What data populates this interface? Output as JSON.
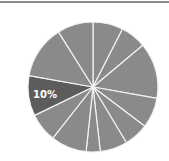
{
  "chart_data": {
    "type": "pie",
    "title": "",
    "start_angle_deg": 0,
    "direction": "clockwise",
    "slice_color": "#8a8a8a",
    "highlight_color": "#5c5c5c",
    "separator_color": "#f2f2f2",
    "values": [
      7.5,
      6.4,
      13.9,
      7.5,
      6.1,
      6.8,
      3.5,
      8.9,
      7.2,
      10.0,
      13.3,
      8.9
    ],
    "highlight_index": 9,
    "labels": [
      "",
      "",
      "",
      "",
      "",
      "",
      "",
      "",
      "",
      "10%",
      "",
      ""
    ],
    "legend": []
  },
  "highlight_label": "10%"
}
